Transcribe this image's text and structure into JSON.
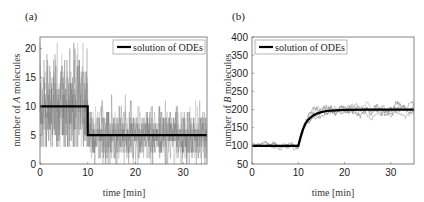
{
  "chart_data": [
    {
      "panel": "(a)",
      "type": "line",
      "title": "",
      "xlabel": "time [min]",
      "ylabel": "number of A molecules",
      "ylabel_italic": "A",
      "xlim": [
        0,
        35
      ],
      "ylim": [
        0,
        22
      ],
      "xticks": [
        0,
        10,
        20,
        30
      ],
      "yticks": [
        0,
        5,
        10,
        15,
        20
      ],
      "legend": {
        "position": "upper right",
        "entries": [
          "solution of ODEs"
        ]
      },
      "grid": false,
      "series": [
        {
          "name": "solution of ODEs",
          "color": "#000000",
          "width": 2.2,
          "x": [
            0,
            10,
            10,
            35
          ],
          "y": [
            10,
            10,
            5,
            5
          ]
        },
        {
          "name": "stochastic trajectories",
          "color": "#777777",
          "style": "noisy",
          "description": "Many stochastic simulation traces fluctuating ~3-20 before t=10 (mean 10) and ~0-13 after t=10 (mean 5)",
          "segments": [
            {
              "t0": 0,
              "t1": 10,
              "mean": 10,
              "min": 3,
              "max": 21
            },
            {
              "t0": 10,
              "t1": 35,
              "mean": 5,
              "min": 0,
              "max": 13
            }
          ]
        }
      ]
    },
    {
      "panel": "(b)",
      "type": "line",
      "title": "",
      "xlabel": "time [min]",
      "ylabel": "number of B molecules",
      "ylabel_italic": "B",
      "xlim": [
        0,
        35
      ],
      "ylim": [
        50,
        400
      ],
      "xticks": [
        0,
        10,
        20,
        30
      ],
      "yticks": [
        50,
        100,
        150,
        200,
        250,
        300,
        350,
        400
      ],
      "legend": {
        "position": "upper left",
        "entries": [
          "solution of ODEs"
        ]
      },
      "grid": false,
      "series": [
        {
          "name": "solution of ODEs",
          "color": "#000000",
          "width": 2.2,
          "x": [
            0,
            10,
            10.5,
            11,
            11.5,
            12,
            13,
            14,
            15,
            16,
            18,
            20,
            25,
            35
          ],
          "y": [
            100,
            100,
            125,
            145,
            160,
            170,
            182,
            189,
            193,
            196,
            198,
            199,
            200,
            200
          ]
        },
        {
          "name": "stochastic trajectories",
          "color": "#888888",
          "style": "noisy",
          "description": "Several stochastic traces around ODE solution: ~85-115 before t=10, rising to ~160-220 after",
          "segments": [
            {
              "t0": 0,
              "t1": 10,
              "mean": 100,
              "min": 85,
              "max": 115
            },
            {
              "t0": 10,
              "t1": 35,
              "mean": 200,
              "min": 160,
              "max": 222
            }
          ]
        }
      ]
    }
  ],
  "panels": {
    "a": {
      "label": "(a)",
      "legend_text": "solution of ODEs",
      "xlabel": "time [min]",
      "ylabel_pre": "number of ",
      "ylabel_var": "A",
      "ylabel_post": " molecules"
    },
    "b": {
      "label": "(b)",
      "legend_text": "solution of ODEs",
      "xlabel": "time [min]",
      "ylabel_pre": "number of ",
      "ylabel_var": "B",
      "ylabel_post": " molecules"
    }
  }
}
